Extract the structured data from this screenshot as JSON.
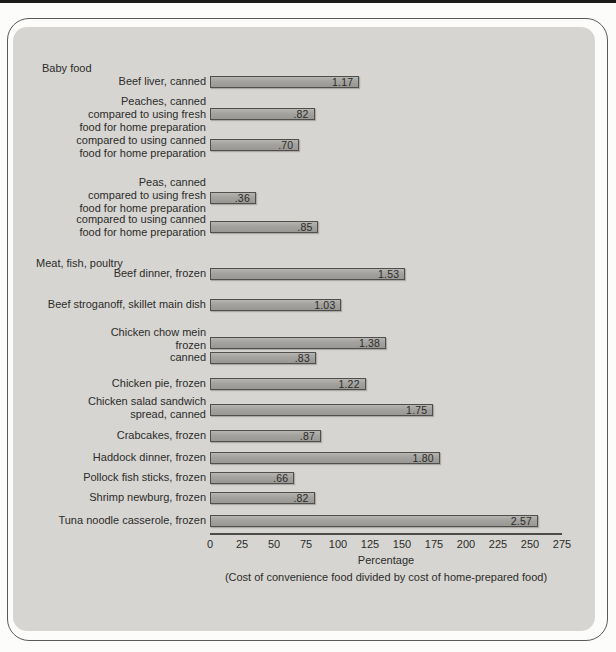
{
  "chart_data": {
    "type": "bar",
    "orientation": "horizontal",
    "xlabel": "Percentage",
    "footnote": "(Cost of convenience food divided by cost of home-prepared food)",
    "x_axis": {
      "min": 0,
      "max": 275,
      "tick_interval": 25,
      "tick_labels": [
        "0",
        "25",
        "50",
        "75",
        "100",
        "125",
        "150",
        "175",
        "200",
        "225",
        "250",
        "275"
      ]
    },
    "sections": [
      {
        "label": "Baby food"
      },
      {
        "label": "Meat, fish, poultry"
      }
    ],
    "rows": [
      {
        "section": "Baby food",
        "label_lines": [
          "Beef liver, canned"
        ],
        "value_label": "1.17",
        "value_percent": 117
      },
      {
        "section": "Baby food",
        "label_lines": [
          "Peaches, canned",
          "compared to using fresh",
          "food for home preparation"
        ],
        "value_label": ".82",
        "value_percent": 82
      },
      {
        "section": "Baby food",
        "label_lines": [
          "compared to using canned",
          "food for home preparation"
        ],
        "value_label": ".70",
        "value_percent": 70
      },
      {
        "section": "Baby food",
        "label_lines": [
          "Peas, canned",
          "compared to using fresh",
          "food for home preparation"
        ],
        "value_label": ".36",
        "value_percent": 36
      },
      {
        "section": "Baby food",
        "label_lines": [
          "compared to using canned",
          "food for home preparation"
        ],
        "value_label": ".85",
        "value_percent": 85
      },
      {
        "section": "Meat, fish, poultry",
        "label_lines": [
          "Beef dinner, frozen"
        ],
        "value_label": "1.53",
        "value_percent": 153
      },
      {
        "section": "Meat, fish, poultry",
        "label_lines": [
          "Beef stroganoff, skillet main dish"
        ],
        "value_label": "1.03",
        "value_percent": 103
      },
      {
        "section": "Meat, fish, poultry",
        "label_lines": [
          "Chicken chow mein",
          "frozen"
        ],
        "value_label": "1.38",
        "value_percent": 138
      },
      {
        "section": "Meat, fish, poultry",
        "label_lines": [
          "canned"
        ],
        "value_label": ".83",
        "value_percent": 83
      },
      {
        "section": "Meat, fish, poultry",
        "label_lines": [
          "Chicken pie, frozen"
        ],
        "value_label": "1.22",
        "value_percent": 122
      },
      {
        "section": "Meat, fish, poultry",
        "label_lines": [
          "Chicken salad sandwich",
          "spread, canned"
        ],
        "value_label": "1.75",
        "value_percent": 175
      },
      {
        "section": "Meat, fish, poultry",
        "label_lines": [
          "Crabcakes, frozen"
        ],
        "value_label": ".87",
        "value_percent": 87
      },
      {
        "section": "Meat, fish, poultry",
        "label_lines": [
          "Haddock dinner, frozen"
        ],
        "value_label": "1.80",
        "value_percent": 180
      },
      {
        "section": "Meat, fish, poultry",
        "label_lines": [
          "Pollock fish sticks, frozen"
        ],
        "value_label": ".66",
        "value_percent": 66
      },
      {
        "section": "Meat, fish, poultry",
        "label_lines": [
          "Shrimp newburg, frozen"
        ],
        "value_label": ".82",
        "value_percent": 82
      },
      {
        "section": "Meat, fish, poultry",
        "label_lines": [
          "Tuna noodle casserole, frozen"
        ],
        "value_label": "2.57",
        "value_percent": 257
      }
    ],
    "colors": {
      "panel_bg": "#d6d5d2",
      "bar_fill": "#a3a29e",
      "bar_border": "#504f4b",
      "axis": "#4b4b47",
      "text": "#2c2c29"
    }
  }
}
